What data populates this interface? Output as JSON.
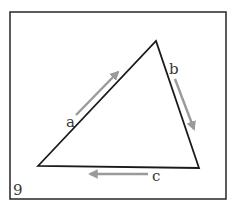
{
  "figure": {
    "number_label": "9",
    "frame": {
      "x": 10,
      "y": 12,
      "width": 216,
      "height": 187,
      "stroke": "#333333"
    },
    "triangle": {
      "vertices": [
        [
          38,
          166
        ],
        [
          156,
          41
        ],
        [
          199,
          168
        ]
      ],
      "stroke": "#1a1a1a"
    },
    "arrows": [
      {
        "id": "a",
        "label": "a",
        "from": [
          76,
          115
        ],
        "to": [
          120,
          70
        ],
        "label_pos": [
          67,
          127
        ]
      },
      {
        "id": "b",
        "label": "b",
        "from": [
          175,
          79
        ],
        "to": [
          195,
          132
        ],
        "label_pos": [
          170,
          74
        ]
      },
      {
        "id": "c",
        "label": "c",
        "from": [
          148,
          174
        ],
        "to": [
          87,
          174
        ],
        "label_pos": [
          152,
          181
        ]
      }
    ],
    "arrow_color": "#9a9a9a",
    "label_color": "#3a3a3a"
  }
}
